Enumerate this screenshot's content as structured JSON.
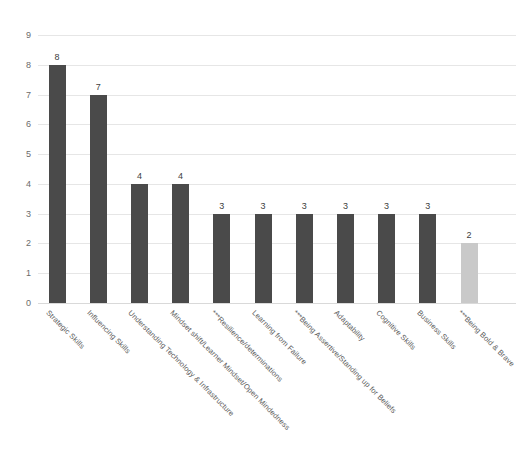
{
  "chart_data": {
    "type": "bar",
    "title": "",
    "subtitle": "",
    "xlabel": "",
    "ylabel": "",
    "ylim": [
      0,
      9
    ],
    "ytick_labels": [
      "0",
      "1",
      "2",
      "3",
      "4",
      "5",
      "6",
      "7",
      "8",
      "9"
    ],
    "grid": true,
    "legend": false,
    "legend_position": "none",
    "categories": [
      "Strategic Skills",
      "Influencing Skills",
      "Understanding Technology & Infrastructure",
      "Mindset shift/Learner Mindset/Open Mindedness",
      "***Resilience/determinations",
      "Learning from Failure",
      "***Being Assertive/Standing up for Beliefs",
      "Adaptability",
      "Cognitive Skills",
      "Business Skills",
      "***Being Bold & Brave"
    ],
    "values": [
      8,
      7,
      4,
      4,
      3,
      3,
      3,
      3,
      3,
      3,
      2
    ],
    "data_labels": [
      "8",
      "7",
      "4",
      "4",
      "3",
      "3",
      "3",
      "3",
      "3",
      "3",
      "2"
    ],
    "bar_colors": [
      "#4a4a4a",
      "#4a4a4a",
      "#4a4a4a",
      "#4a4a4a",
      "#4a4a4a",
      "#4a4a4a",
      "#4a4a4a",
      "#4a4a4a",
      "#4a4a4a",
      "#4a4a4a",
      "#c9c9c9"
    ],
    "colors": {
      "bar_default": "#4a4a4a",
      "bar_highlight": "#c9c9c9",
      "gridline": "#e6e6e6",
      "axis_text": "#6b6b6b",
      "label_text": "#5d5d5d",
      "background": "#ffffff"
    }
  }
}
